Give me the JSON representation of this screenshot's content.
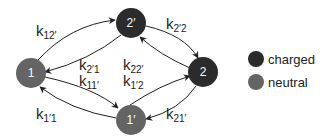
{
  "colors": {
    "charged": "#2b2b2b",
    "neutral": "#646464",
    "edge": "#222222",
    "node_text": "#ffffff"
  },
  "nodes": [
    {
      "id": "1",
      "label": "1",
      "type": "neutral"
    },
    {
      "id": "2p",
      "label": "2′",
      "type": "charged"
    },
    {
      "id": "2",
      "label": "2",
      "type": "charged"
    },
    {
      "id": "1p",
      "label": "1′",
      "type": "neutral"
    }
  ],
  "rates": {
    "k12p": {
      "base": "k",
      "sub": "12′"
    },
    "k2p2": {
      "base": "k",
      "sub": "2′2"
    },
    "k2p1": {
      "base": "k",
      "sub": "2′1"
    },
    "k11p": {
      "base": "k",
      "sub": "11′"
    },
    "k22p": {
      "base": "k",
      "sub": "22′"
    },
    "k1p2": {
      "base": "k",
      "sub": "1′2"
    },
    "k1p1": {
      "base": "k",
      "sub": "1′1"
    },
    "k21p": {
      "base": "k",
      "sub": "21′"
    }
  },
  "legend": {
    "charged": "charged",
    "neutral": "neutral"
  }
}
